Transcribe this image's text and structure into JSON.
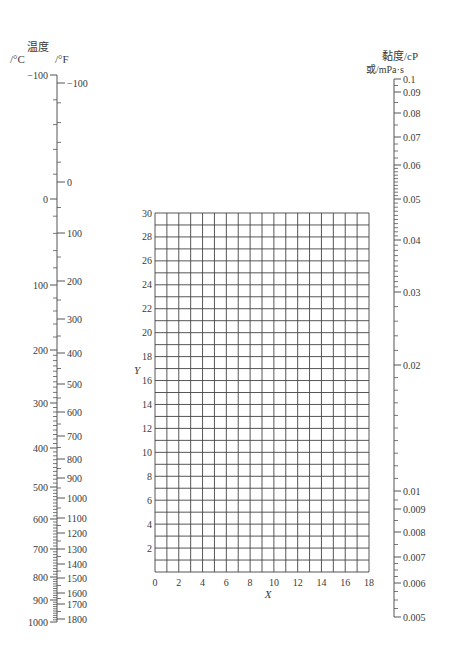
{
  "chart_data": {
    "type": "nomograph",
    "title": "",
    "left_scale": {
      "title": "温度",
      "unit_c": "/°C",
      "unit_f": "/°F",
      "celsius_ticks": [
        {
          "label": "-100",
          "y": 75
        },
        {
          "label": "0",
          "y": 199
        },
        {
          "label": "100",
          "y": 285
        },
        {
          "label": "200",
          "y": 350
        },
        {
          "label": "300",
          "y": 403
        },
        {
          "label": "400",
          "y": 448
        },
        {
          "label": "500",
          "y": 487
        },
        {
          "label": "600",
          "y": 519
        },
        {
          "label": "700",
          "y": 549
        },
        {
          "label": "800",
          "y": 577
        },
        {
          "label": "900",
          "y": 600
        },
        {
          "label": "1000",
          "y": 622
        }
      ],
      "fahrenheit_ticks": [
        {
          "label": "-100",
          "y": 83
        },
        {
          "label": "0",
          "y": 182
        },
        {
          "label": "100",
          "y": 233
        },
        {
          "label": "200",
          "y": 281
        },
        {
          "label": "300",
          "y": 319
        },
        {
          "label": "400",
          "y": 353
        },
        {
          "label": "500",
          "y": 384
        },
        {
          "label": "600",
          "y": 412
        },
        {
          "label": "700",
          "y": 436
        },
        {
          "label": "800",
          "y": 459
        },
        {
          "label": "900",
          "y": 478
        },
        {
          "label": "1000",
          "y": 498
        },
        {
          "label": "1100",
          "y": 518
        },
        {
          "label": "1200",
          "y": 533
        },
        {
          "label": "1300",
          "y": 549
        },
        {
          "label": "1400",
          "y": 564
        },
        {
          "label": "1500",
          "y": 578
        },
        {
          "label": "1600",
          "y": 593
        },
        {
          "label": "1700",
          "y": 604
        },
        {
          "label": "1800",
          "y": 619
        }
      ]
    },
    "grid": {
      "xlabel": "X",
      "ylabel": "Y",
      "xlim": [
        0,
        18
      ],
      "ylim": [
        0,
        30
      ],
      "x_ticks": [
        "0",
        "2",
        "4",
        "6",
        "8",
        "10",
        "12",
        "14",
        "16",
        "18"
      ],
      "y_ticks": [
        "2",
        "4",
        "6",
        "8",
        "10",
        "12",
        "14",
        "16",
        "18",
        "20",
        "22",
        "24",
        "26",
        "28",
        "30"
      ],
      "grid_on": true
    },
    "right_scale": {
      "title": "黏度/cP",
      "subtitle": "或/mPa·s",
      "ticks": [
        {
          "label": "0.1",
          "y": 79
        },
        {
          "label": "0.09",
          "y": 92
        },
        {
          "label": "0.08",
          "y": 113
        },
        {
          "label": "0.07",
          "y": 137
        },
        {
          "label": "0.06",
          "y": 165
        },
        {
          "label": "0.05",
          "y": 199
        },
        {
          "label": "0.04",
          "y": 240
        },
        {
          "label": "0.03",
          "y": 292
        },
        {
          "label": "0.02",
          "y": 365
        },
        {
          "label": "0.01",
          "y": 491
        },
        {
          "label": "0.009",
          "y": 509
        },
        {
          "label": "0.008",
          "y": 532
        },
        {
          "label": "0.007",
          "y": 557
        },
        {
          "label": "0.006",
          "y": 583
        },
        {
          "label": "0.005",
          "y": 617
        }
      ]
    }
  }
}
